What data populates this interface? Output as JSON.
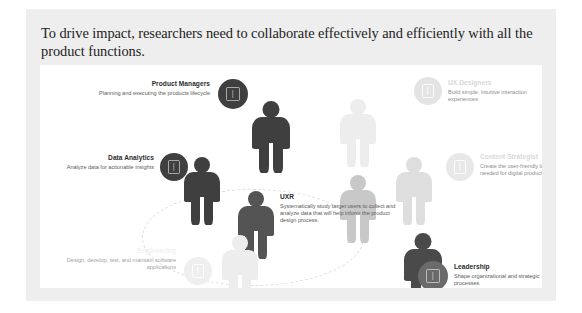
{
  "slide": {
    "title": "To drive impact, researchers need to collaborate effectively and efficiently with all the product functions."
  },
  "diagram": {
    "center": {
      "title": "UXR",
      "description": "Systematically study target users to collect and analyze data that will help inform the product design process."
    },
    "roles": [
      {
        "key": "product-managers",
        "title": "Product Managers",
        "description": "Planning and executing the products lifecycle",
        "tone": "dark",
        "icon": "badge-icon"
      },
      {
        "key": "data-analytics",
        "title": "Data Analytics",
        "description": "Analyze data for actionable insights",
        "tone": "dark",
        "icon": "badge-icon"
      },
      {
        "key": "engineering",
        "title": "Engineering",
        "description": "Design, develop, test, and maintain software applications",
        "tone": "ghost",
        "icon": "badge-icon"
      },
      {
        "key": "ux-designers",
        "title": "UX Designers",
        "description": "Build simple, intuitive interaction experiences",
        "tone": "pale",
        "icon": "badge-icon"
      },
      {
        "key": "content-strategist",
        "title": "Content Strategist",
        "description": "Create the user-friendly language needed for digital product experiences",
        "tone": "pale",
        "icon": "badge-icon"
      },
      {
        "key": "leadership",
        "title": "Leadership",
        "description": "Shape organizational and strategic processes",
        "tone": "mid",
        "icon": "badge-icon"
      }
    ]
  },
  "colors": {
    "slide_background": "#eeeeee",
    "card_background": "#ffffff",
    "title_text": "#1d1d1d",
    "figure_dark": "#3f3f3f",
    "figure_mid": "#9b9b9b",
    "figure_light": "#dcdcdc",
    "figure_faint": "#ededed",
    "ellipse_dash": "#dcdcdc"
  }
}
